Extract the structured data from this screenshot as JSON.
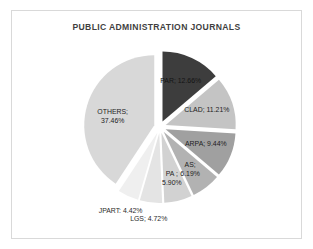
{
  "chart_data": {
    "type": "pie",
    "title": "PUBLIC ADMINISTRATION JOURNALS",
    "xlabel": "",
    "ylabel": "",
    "legend": "none",
    "grid": false,
    "labels_format": "NAME; VALUE%",
    "categories": [
      "PAR",
      "CLAD",
      "ARPA",
      "AS",
      "PA",
      "LGS",
      "JPART",
      "OTHERS"
    ],
    "values": [
      12.66,
      11.21,
      9.44,
      6.19,
      5.9,
      4.72,
      4.42,
      37.46
    ],
    "slices": [
      {
        "name": "PAR",
        "value": 12.66,
        "label": "PAR; 12.66%",
        "color": "#3d3d3d"
      },
      {
        "name": "CLAD",
        "value": 11.21,
        "label": "CLAD; 11.21%",
        "color": "#c4c4c4"
      },
      {
        "name": "ARPA",
        "value": 9.44,
        "label": "ARPA; 9.44%",
        "color": "#a0a0a0"
      },
      {
        "name": "AS",
        "value": 6.19,
        "label": "AS; 6.19%",
        "color": "#b2b2b2"
      },
      {
        "name": "AS_DARK",
        "value": 0,
        "label": "",
        "color": "#101010"
      },
      {
        "name": "PA",
        "value": 5.9,
        "label": "PA ; 5.90%",
        "color": "#d2d2d2"
      },
      {
        "name": "LGS",
        "value": 4.72,
        "label": "LGS; 4.72%",
        "color": "#e4e4e4"
      },
      {
        "name": "JPART",
        "value": 4.42,
        "label": "JPART; 4.42%",
        "color": "#efefef"
      },
      {
        "name": "OTHERS",
        "value": 37.46,
        "label": "OTHERS; 37.46%",
        "color": "#d8d8d8"
      }
    ],
    "label_lines": {
      "par": {
        "line1": "PAR; 12.66%",
        "line2": ""
      },
      "clad": {
        "line1": "CLAD; 11.21%",
        "line2": ""
      },
      "arpa": {
        "line1": "ARPA; 9.44%",
        "line2": ""
      },
      "as": {
        "line1": "AS;",
        "line2": "6.19%"
      },
      "pa": {
        "line1": "PA ;",
        "line2": "5.90%"
      },
      "lgs": {
        "line1": "LGS; 4.72%",
        "line2": ""
      },
      "jpart": {
        "line1": "JPART: 4.42%",
        "line2": ""
      },
      "others": {
        "line1": "OTHERS;",
        "line2": "37.46%"
      }
    },
    "colors": {
      "background": "#ffffff",
      "frame_border": "#d9d9d9",
      "title_color": "#3f3f3f",
      "label_color": "#1d1d1d"
    }
  }
}
